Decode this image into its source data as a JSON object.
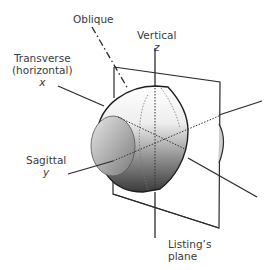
{
  "labels": {
    "oblique": "Oblique",
    "vertical": "Vertical",
    "vertical_axis": "z",
    "transverse_line1": "Transverse",
    "transverse_line2": "(horizontal)",
    "transverse_axis": "x",
    "sagittal": "Sagittal",
    "sagittal_axis": "y",
    "listing_line1": "Listing’s",
    "listing_line2": "plane"
  },
  "colors": {
    "stroke": "#2a2a2a",
    "text": "#3a3a3a",
    "eye_light": "#f4f4f4",
    "eye_dark": "#3c3c3c"
  }
}
